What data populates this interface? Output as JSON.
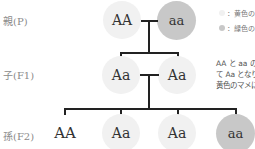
{
  "generations": [
    {
      "label": "親(P)"
    },
    {
      "label": "子(F1)"
    },
    {
      "label": "孫(F2)"
    }
  ],
  "parents": [
    {
      "genotype": "AA",
      "phenotype": "yellow"
    },
    {
      "genotype": "aa",
      "phenotype": "green"
    }
  ],
  "f1": [
    {
      "genotype": "Aa",
      "phenotype": "yellow"
    },
    {
      "genotype": "Aa",
      "phenotype": "yellow"
    }
  ],
  "f2": [
    {
      "genotype": "AA",
      "phenotype": "yellow"
    },
    {
      "genotype": "Aa",
      "phenotype": "yellow"
    },
    {
      "genotype": "Aa",
      "phenotype": "yellow"
    },
    {
      "genotype": "aa",
      "phenotype": "green"
    }
  ],
  "legend": [
    {
      "text": "：黄色の",
      "color": "#f1f1f1"
    },
    {
      "text": "：緑色の",
      "color": "#c8c8c8"
    }
  ],
  "note": {
    "lines": [
      "AA と aa の",
      "て Aa となり",
      "黄色のマメに"
    ]
  },
  "colors": {
    "yellow_node": "#f1f1f1",
    "green_node": "#c8c8c8",
    "line": "#222222"
  }
}
